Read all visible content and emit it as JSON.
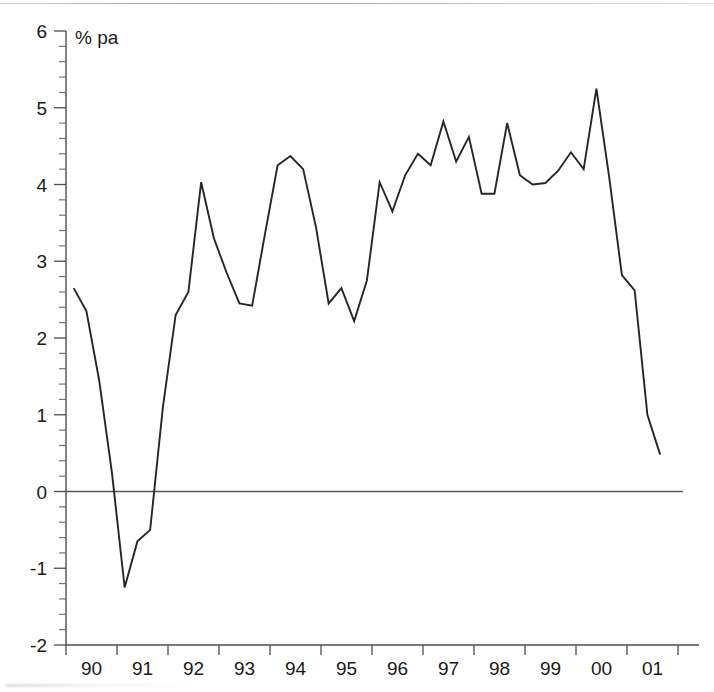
{
  "chart_data": {
    "type": "line",
    "title": "",
    "subtitle": "",
    "unit_label": "% pa",
    "xlabel": "",
    "ylabel": "",
    "ylim": [
      -2,
      6
    ],
    "xlim": [
      1989.75,
      2001.75
    ],
    "y_ticks": [
      -2,
      -1,
      0,
      1,
      2,
      3,
      4,
      5,
      6
    ],
    "y_tick_labels": [
      "-2",
      "-1",
      "0",
      "1",
      "2",
      "3",
      "4",
      "5",
      "6"
    ],
    "y_minor_step": 0.2,
    "x_tick_labels": [
      "90",
      "91",
      "92",
      "93",
      "94",
      "95",
      "96",
      "97",
      "98",
      "99",
      "00",
      "01"
    ],
    "x_tick_years": [
      1990,
      1991,
      1992,
      1993,
      1994,
      1995,
      1996,
      1997,
      1998,
      1999,
      2000,
      2001
    ],
    "grid": false,
    "legend": "none",
    "zero_reference_line": true,
    "series": [
      {
        "name": "Growth rate",
        "color": "#262626",
        "x": [
          1989.9,
          1990.15,
          1990.4,
          1990.65,
          1990.9,
          1991.15,
          1991.4,
          1991.65,
          1991.9,
          1992.15,
          1992.4,
          1992.65,
          1992.9,
          1993.15,
          1993.4,
          1993.65,
          1993.9,
          1994.15,
          1994.4,
          1994.65,
          1994.9,
          1995.15,
          1995.4,
          1995.65,
          1995.9,
          1996.15,
          1996.4,
          1996.65,
          1996.9,
          1997.15,
          1997.4,
          1997.65,
          1997.9,
          1998.15,
          1998.4,
          1998.65,
          1998.9,
          1999.15,
          1999.4,
          1999.65,
          1999.9,
          2000.15,
          2000.4,
          2000.65,
          2000.9,
          2001.15,
          2001.4
        ],
        "values": [
          2.65,
          2.35,
          1.45,
          0.25,
          -1.25,
          -0.65,
          -0.5,
          1.1,
          2.3,
          2.6,
          4.03,
          3.3,
          2.85,
          2.45,
          2.42,
          3.35,
          4.25,
          4.37,
          4.2,
          3.45,
          2.45,
          2.65,
          2.22,
          2.75,
          4.03,
          3.65,
          4.12,
          4.4,
          4.25,
          4.82,
          4.3,
          4.62,
          3.88,
          3.88,
          4.8,
          4.12,
          4.0,
          4.02,
          4.18,
          4.42,
          4.2,
          5.25,
          4.1,
          2.82,
          2.62,
          1.0,
          0.48
        ]
      }
    ]
  },
  "axes": {
    "unit_label": "% pa"
  }
}
